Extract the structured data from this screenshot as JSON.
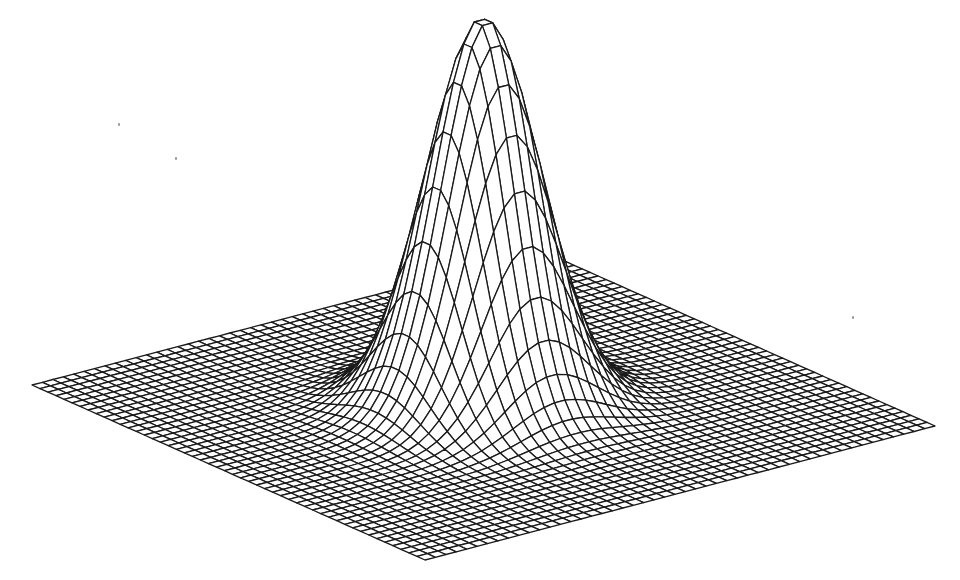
{
  "figure": {
    "type": "wireframe-surface",
    "function": "z = exp(-(x^2 + y^2) / (2*sigma^2))",
    "grid": {
      "rows": 50,
      "cols": 50,
      "domain": [
        -1,
        1
      ],
      "sigma": 0.18
    },
    "projection": {
      "left_corner": [
        32,
        385
      ],
      "bottom_corner": [
        425,
        560
      ],
      "right_corner": [
        935,
        426
      ],
      "back_corner": [
        542,
        251
      ],
      "peak_height_px": 388
    },
    "colors": {
      "background": "#ffffff",
      "line": "#1a1a1a"
    },
    "line_width": 1.3,
    "caption_cropped": true
  },
  "specks": [
    [
      118,
      123
    ],
    [
      175,
      157
    ],
    [
      852,
      316
    ]
  ]
}
